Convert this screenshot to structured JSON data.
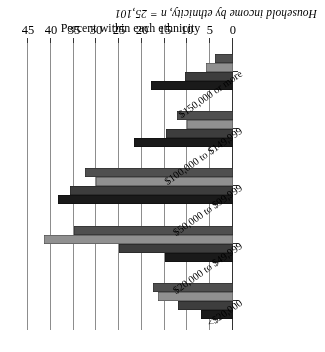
{
  "figure": {
    "title": "Household income by ethnicity, n = 25,101"
  },
  "chart_data": {
    "type": "bar",
    "orientation": "horizontal",
    "title": "Household income by ethnicity, n = 25,101",
    "xlabel": "Percent within each ethnicity",
    "ylabel": "",
    "xlim": [
      0,
      45
    ],
    "xticks": [
      "0",
      "5",
      "10",
      "15",
      "20",
      "25",
      "30",
      "35",
      "40",
      "45"
    ],
    "grid": true,
    "legend_position": "none",
    "rotation_note": "Figure appears rotated 180 degrees in the source scan",
    "categories": [
      "<$20,000",
      "$20,000 to $49,999",
      "$50,000 to $99,999",
      "$100,000 to $149,999",
      "$150,000 or more"
    ],
    "series": [
      {
        "name": "Series 1",
        "color": "#1a1a1a",
        "values": [
          7.0,
          15.0,
          38.4,
          21.7,
          18.0
        ]
      },
      {
        "name": "Series 2",
        "color": "#3d3d3d",
        "values": [
          12.0,
          25.0,
          35.8,
          14.7,
          10.5
        ]
      },
      {
        "name": "Series 3",
        "color": "#909090",
        "values": [
          16.5,
          41.5,
          30.0,
          10.0,
          6.0
        ]
      },
      {
        "name": "Series 4",
        "color": "#4f4f4f",
        "values": [
          17.5,
          35.0,
          32.5,
          12.3,
          4.0
        ]
      }
    ]
  }
}
